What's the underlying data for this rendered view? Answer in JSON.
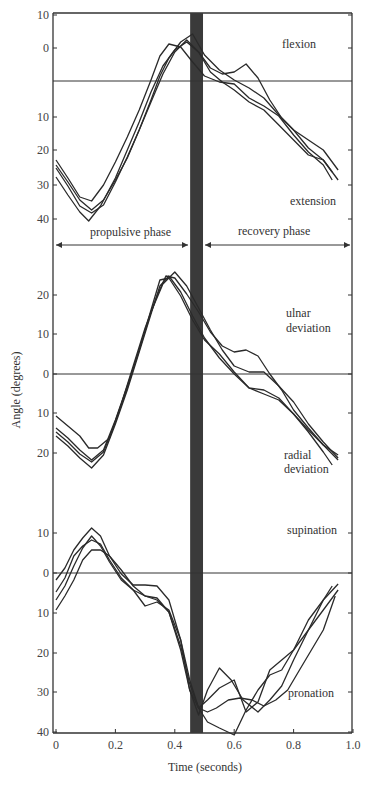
{
  "chart_data": {
    "type": "line",
    "title": "",
    "xlabel": "Time (seconds)",
    "ylabel": "Angle (degrees)",
    "xlim": [
      0,
      1.0
    ],
    "x_ticks": [
      "0",
      "0.2",
      "0.4",
      "0.6",
      "0.8",
      "1.0"
    ],
    "x_tick_values": [
      0,
      0.2,
      0.4,
      0.6,
      0.8,
      1.0
    ],
    "grid": false,
    "shaded_band": {
      "x_start": 0.455,
      "x_end": 0.495,
      "color": "#3a3a3a",
      "label": "phase transition"
    },
    "phases": [
      {
        "label": "propulsive phase",
        "x_start": 0,
        "x_end": 0.455
      },
      {
        "label": "recovery phase",
        "x_start": 0.495,
        "x_end": 1.0
      }
    ],
    "panels": [
      {
        "name": "flexion-extension",
        "positive_label": "flexion",
        "negative_label": "extension",
        "y_ticks": [
          {
            "label": "10",
            "py": 15
          },
          {
            "label": "0",
            "py": 48
          },
          {
            "label": "10",
            "py": 117
          },
          {
            "label": "20",
            "py": 150
          },
          {
            "label": "30",
            "py": 185
          },
          {
            "label": "40",
            "py": 219
          }
        ],
        "zero_py": 81,
        "units_note": "upward = flexion, downward = extension (degrees)",
        "series": [
          {
            "name": "trial 1",
            "t": [
              0,
              0.04,
              0.08,
              0.12,
              0.16,
              0.2,
              0.24,
              0.28,
              0.32,
              0.35,
              0.38,
              0.42,
              0.46,
              0.5,
              0.55,
              0.6,
              0.65,
              0.7,
              0.75,
              0.8,
              0.85,
              0.9,
              0.93
            ],
            "py": [
              160,
              178,
              197,
              201,
              185,
              162,
              137,
              110,
              80,
              56,
              44,
              47,
              62,
              76,
              82,
              84,
              98,
              106,
              116,
              135,
              152,
              165,
              180
            ]
          },
          {
            "name": "trial 2",
            "t": [
              0,
              0.04,
              0.08,
              0.12,
              0.16,
              0.2,
              0.24,
              0.28,
              0.32,
              0.35,
              0.38,
              0.42,
              0.46,
              0.5,
              0.55,
              0.6,
              0.65,
              0.7,
              0.75,
              0.8,
              0.85,
              0.9,
              0.95
            ],
            "py": [
              168,
              186,
              206,
              213,
              205,
              182,
              157,
              130,
              100,
              76,
              58,
              42,
              34,
              55,
              70,
              80,
              88,
              98,
              115,
              130,
              148,
              160,
              180
            ]
          },
          {
            "name": "trial 3",
            "t": [
              0,
              0.04,
              0.08,
              0.11,
              0.15,
              0.2,
              0.24,
              0.28,
              0.32,
              0.36,
              0.4,
              0.44,
              0.48,
              0.52,
              0.56,
              0.6,
              0.64,
              0.68,
              0.72,
              0.76,
              0.8,
              0.85,
              0.9,
              0.95
            ],
            "py": [
              177,
              195,
              212,
              221,
              206,
              178,
              150,
              122,
              92,
              66,
              50,
              42,
              52,
              68,
              74,
              72,
              64,
              78,
              100,
              118,
              130,
              140,
              150,
              170
            ]
          },
          {
            "name": "trial 4",
            "t": [
              0,
              0.04,
              0.08,
              0.12,
              0.16,
              0.2,
              0.24,
              0.28,
              0.32,
              0.36,
              0.4,
              0.44,
              0.48,
              0.52,
              0.56,
              0.6,
              0.65,
              0.7,
              0.75,
              0.8,
              0.85,
              0.9,
              0.93
            ],
            "py": [
              165,
              182,
              200,
              210,
              200,
              180,
              158,
              130,
              102,
              74,
              52,
              40,
              52,
              72,
              82,
              90,
              102,
              110,
              125,
              140,
              155,
              160,
              172
            ]
          }
        ]
      },
      {
        "name": "ulnar-radial-deviation",
        "positive_label": "ulnar deviation",
        "negative_label": "radial deviation",
        "y_ticks": [
          {
            "label": "20",
            "py": 295
          },
          {
            "label": "10",
            "py": 334
          },
          {
            "label": "0",
            "py": 374
          },
          {
            "label": "10",
            "py": 413
          },
          {
            "label": "20",
            "py": 453
          }
        ],
        "zero_py": 374,
        "units_note": "upward = ulnar deviation, downward = radial deviation (degrees)",
        "series": [
          {
            "name": "trial 1",
            "t": [
              0,
              0.04,
              0.08,
              0.12,
              0.16,
              0.2,
              0.24,
              0.28,
              0.32,
              0.35,
              0.38,
              0.42,
              0.46,
              0.5,
              0.55,
              0.6,
              0.65,
              0.7,
              0.75,
              0.8,
              0.85,
              0.9,
              0.93
            ],
            "py": [
              428,
              438,
              450,
              460,
              450,
              420,
              386,
              350,
              310,
              280,
              278,
              296,
              320,
              340,
              354,
              372,
              388,
              394,
              400,
              414,
              432,
              452,
              465
            ]
          },
          {
            "name": "trial 2",
            "t": [
              0,
              0.04,
              0.08,
              0.12,
              0.16,
              0.2,
              0.24,
              0.28,
              0.32,
              0.35,
              0.38,
              0.42,
              0.46,
              0.5,
              0.55,
              0.6,
              0.65,
              0.7,
              0.75,
              0.8,
              0.85,
              0.9,
              0.95
            ],
            "py": [
              436,
              446,
              458,
              468,
              455,
              424,
              390,
              352,
              314,
              286,
              276,
              292,
              316,
              338,
              358,
              374,
              388,
              390,
              398,
              414,
              430,
              445,
              460
            ]
          },
          {
            "name": "trial 3",
            "t": [
              0,
              0.04,
              0.08,
              0.11,
              0.14,
              0.18,
              0.22,
              0.26,
              0.3,
              0.34,
              0.37,
              0.4,
              0.44,
              0.48,
              0.52,
              0.56,
              0.6,
              0.64,
              0.68,
              0.72,
              0.76,
              0.8,
              0.85,
              0.9,
              0.95
            ],
            "py": [
              416,
              426,
              436,
              448,
              448,
              438,
              404,
              366,
              328,
              296,
              276,
              278,
              294,
              312,
              332,
              346,
              352,
              350,
              356,
              374,
              390,
              410,
              428,
              445,
              455
            ]
          },
          {
            "name": "trial 4",
            "t": [
              0,
              0.04,
              0.08,
              0.12,
              0.16,
              0.2,
              0.24,
              0.28,
              0.32,
              0.36,
              0.4,
              0.44,
              0.48,
              0.52,
              0.56,
              0.6,
              0.65,
              0.7,
              0.75,
              0.8,
              0.85,
              0.9,
              0.95
            ],
            "py": [
              432,
              442,
              454,
              462,
              452,
              422,
              388,
              350,
              312,
              284,
              272,
              286,
              308,
              330,
              350,
              366,
              372,
              372,
              386,
              402,
              424,
              442,
              458
            ]
          }
        ]
      },
      {
        "name": "supination-pronation",
        "positive_label": "supination",
        "negative_label": "pronation",
        "y_ticks": [
          {
            "label": "10",
            "py": 533
          },
          {
            "label": "0",
            "py": 573
          },
          {
            "label": "10",
            "py": 613
          },
          {
            "label": "20",
            "py": 653
          },
          {
            "label": "30",
            "py": 692
          },
          {
            "label": "40",
            "py": 732
          }
        ],
        "zero_py": 573,
        "units_note": "upward = supination, downward = pronation (degrees)",
        "series": [
          {
            "name": "trial 1",
            "t": [
              0,
              0.03,
              0.06,
              0.09,
              0.12,
              0.15,
              0.18,
              0.22,
              0.26,
              0.3,
              0.34,
              0.38,
              0.42,
              0.45,
              0.48,
              0.51,
              0.55,
              0.59,
              0.63,
              0.68,
              0.72,
              0.76,
              0.8,
              0.85,
              0.9,
              0.93
            ],
            "py": [
              580,
              568,
              550,
              538,
              528,
              536,
              556,
              574,
              585,
              585,
              586,
              600,
              640,
              690,
              715,
              690,
              668,
              680,
              700,
              712,
              700,
              686,
              660,
              630,
              600,
              586
            ]
          },
          {
            "name": "trial 2",
            "t": [
              0,
              0.03,
              0.06,
              0.09,
              0.12,
              0.15,
              0.18,
              0.22,
              0.26,
              0.3,
              0.34,
              0.38,
              0.42,
              0.45,
              0.48,
              0.51,
              0.55,
              0.6,
              0.64,
              0.68,
              0.72,
              0.76,
              0.8,
              0.85,
              0.9,
              0.95
            ],
            "py": [
              592,
              578,
              556,
              546,
              540,
              544,
              560,
              578,
              590,
              606,
              602,
              610,
              640,
              680,
              708,
              700,
              688,
              680,
              712,
              702,
              670,
              660,
              650,
              630,
              610,
              590
            ]
          },
          {
            "name": "trial 3",
            "t": [
              0,
              0.03,
              0.06,
              0.09,
              0.12,
              0.15,
              0.18,
              0.22,
              0.26,
              0.3,
              0.34,
              0.38,
              0.42,
              0.45,
              0.48,
              0.51,
              0.55,
              0.6,
              0.64,
              0.68,
              0.72,
              0.76,
              0.8,
              0.85,
              0.9,
              0.95
            ],
            "py": [
              600,
              586,
              566,
              548,
              536,
              546,
              562,
              580,
              590,
              596,
              598,
              612,
              650,
              690,
              708,
              722,
              728,
              735,
              710,
              690,
              675,
              670,
              650,
              620,
              600,
              584
            ]
          },
          {
            "name": "trial 4",
            "t": [
              0,
              0.03,
              0.06,
              0.09,
              0.12,
              0.15,
              0.18,
              0.22,
              0.26,
              0.3,
              0.34,
              0.38,
              0.42,
              0.45,
              0.48,
              0.51,
              0.54,
              0.58,
              0.62,
              0.66,
              0.7,
              0.74,
              0.78,
              0.82,
              0.86,
              0.9,
              0.94
            ],
            "py": [
              610,
              596,
              580,
              560,
              550,
              550,
              556,
              570,
              586,
              596,
              600,
              612,
              646,
              684,
              708,
              712,
              708,
              700,
              698,
              700,
              706,
              700,
              690,
              670,
              650,
              630,
              596
            ]
          }
        ]
      }
    ]
  },
  "labels": {
    "flexion": "flexion",
    "extension": "extension",
    "propulsive": "propulsive phase",
    "recovery": "recovery phase",
    "ulnar1": "ulnar",
    "ulnar2": "deviation",
    "radial1": "radial",
    "radial2": "deviation",
    "supination": "supination",
    "pronation": "pronation",
    "xlabel": "Time (seconds)",
    "ylabel": "Angle (degrees)"
  }
}
